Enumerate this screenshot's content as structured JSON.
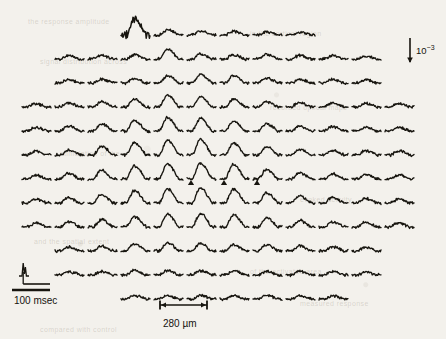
{
  "figure": {
    "type": "optical-imaging-trace-array",
    "background_color": "#f3f1ec",
    "trace_color": "#17150f"
  },
  "scalebars": {
    "time": {
      "label": "100 msec",
      "x": 14,
      "y": 295,
      "bar_x1": 12,
      "bar_x2": 50,
      "bar_y": 290
    },
    "distance": {
      "label": "280 µm",
      "x": 163,
      "y": 318,
      "bar_x1": 160,
      "bar_x2": 207,
      "bar_y": 305
    },
    "amplitude": {
      "label": "10",
      "exponent": "−3",
      "x": 416,
      "y": 44,
      "bar_x": 410,
      "bar_y1": 38,
      "bar_y2": 62
    }
  },
  "stimulus_icon": {
    "name": "stimulus-waveform",
    "x": 18,
    "y": 262
  },
  "markers": {
    "symbol": "triangle",
    "count": 3,
    "positions": [
      {
        "col": 5,
        "row": 6
      },
      {
        "col": 6,
        "row": 6
      },
      {
        "col": 7,
        "row": 6
      }
    ]
  },
  "grid": {
    "rows": 12,
    "cols": 12,
    "origin_x": 22,
    "origin_y": 18,
    "col_pitch": 33,
    "row_pitch": 24,
    "trace_width": 29,
    "trace_height": 17,
    "row_col_ranges": [
      {
        "row": 0,
        "start": 3,
        "count": 6
      },
      {
        "row": 1,
        "start": 1,
        "count": 10
      },
      {
        "row": 2,
        "start": 1,
        "count": 10
      },
      {
        "row": 3,
        "start": 0,
        "count": 12
      },
      {
        "row": 4,
        "start": 0,
        "count": 12
      },
      {
        "row": 5,
        "start": 0,
        "count": 12
      },
      {
        "row": 6,
        "start": 0,
        "count": 12
      },
      {
        "row": 7,
        "start": 0,
        "count": 12
      },
      {
        "row": 8,
        "start": 0,
        "count": 12
      },
      {
        "row": 9,
        "start": 1,
        "count": 10
      },
      {
        "row": 10,
        "start": 1,
        "count": 10
      },
      {
        "row": 11,
        "start": 3,
        "count": 7
      }
    ]
  },
  "chart_data": {
    "type": "line",
    "title": "",
    "xlabel": "",
    "ylabel": "",
    "grid": false,
    "legend": null,
    "units": {
      "time": "msec",
      "amplitude": "fractional change (10^-3)",
      "space": "µm"
    },
    "amplitude_map": [
      [
        0,
        0,
        0,
        1.0,
        0.34,
        0.26,
        0.22,
        0.2,
        0.18,
        0,
        0,
        0
      ],
      [
        0,
        0.2,
        0.22,
        0.28,
        0.62,
        0.3,
        0.26,
        0.3,
        0.22,
        0.2,
        0.18,
        0
      ],
      [
        0,
        0.22,
        0.24,
        0.28,
        0.44,
        0.56,
        0.5,
        0.32,
        0.26,
        0.24,
        0.22,
        0.2
      ],
      [
        0.22,
        0.26,
        0.34,
        0.5,
        0.74,
        0.66,
        0.48,
        0.34,
        0.3,
        0.26,
        0.24,
        0.22
      ],
      [
        0.24,
        0.3,
        0.44,
        0.68,
        0.86,
        0.8,
        0.62,
        0.44,
        0.32,
        0.28,
        0.26,
        0.24
      ],
      [
        0.26,
        0.34,
        0.54,
        0.8,
        0.96,
        1.0,
        0.78,
        0.52,
        0.36,
        0.3,
        0.28,
        0.26
      ],
      [
        0.26,
        0.36,
        0.56,
        0.84,
        0.98,
        1.0,
        0.94,
        0.6,
        0.4,
        0.32,
        0.28,
        0.26
      ],
      [
        0.26,
        0.34,
        0.52,
        0.78,
        0.92,
        0.96,
        0.88,
        0.64,
        0.44,
        0.34,
        0.3,
        0.26
      ],
      [
        0.24,
        0.32,
        0.46,
        0.66,
        0.8,
        0.84,
        0.76,
        0.58,
        0.42,
        0.34,
        0.3,
        0.26
      ],
      [
        0,
        0.26,
        0.3,
        0.46,
        0.52,
        0.48,
        0.42,
        0.4,
        0.34,
        0.28,
        0.24,
        0
      ],
      [
        0,
        0.22,
        0.24,
        0.28,
        0.3,
        0.28,
        0.26,
        0.24,
        0.26,
        0.22,
        0.2,
        0
      ],
      [
        0,
        0,
        0,
        0.22,
        0.2,
        0.22,
        0.2,
        0.24,
        0.2,
        0.22,
        0,
        0
      ]
    ],
    "peak_time_fraction": 0.46,
    "noisy_traces": [
      {
        "row": 0,
        "col": 3
      }
    ]
  },
  "ghost_text": [
    {
      "text": "the response amplitude",
      "x": 28,
      "y": 18
    },
    {
      "text": "in the cortical region",
      "x": 250,
      "y": 30
    },
    {
      "text": "signal distribution across",
      "x": 40,
      "y": 58
    },
    {
      "text": "recorded optical maps",
      "x": 270,
      "y": 104
    },
    {
      "text": "stimulation of the",
      "x": 60,
      "y": 150
    },
    {
      "text": "evoked activity",
      "x": 300,
      "y": 196
    },
    {
      "text": "and the spatial extent",
      "x": 34,
      "y": 238
    },
    {
      "text": "of the activated area",
      "x": 250,
      "y": 268
    },
    {
      "text": "measured response",
      "x": 300,
      "y": 300
    },
    {
      "text": "compared with control",
      "x": 40,
      "y": 326
    }
  ]
}
